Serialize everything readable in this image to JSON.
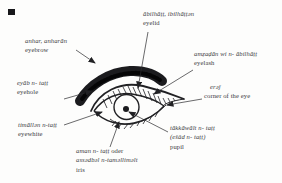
{
  "figure": {
    "background": "#fdfdfc",
    "ink_color": "#212124",
    "text_color": "#3b3b3f"
  },
  "labels": {
    "eyelid": {
      "term": "ābilhāṭṭ, ibilhāṭṭən",
      "gloss": "eyelid"
    },
    "eyebrow": {
      "term": "anhar, anharān",
      "gloss": "eyebrow"
    },
    "eyelash": {
      "term": "amẓaḍān wi n- ābilhāṭṭ",
      "gloss": "eyelash"
    },
    "eyehole": {
      "term": "eyāb n- taṭṭ",
      "gloss": "eyehole"
    },
    "corner": {
      "term": "erəǰ",
      "gloss": "corner of the eye"
    },
    "eyewhite": {
      "term": "timāllən n-taṭṭ",
      "gloss": "eyewhite"
    },
    "pupil": {
      "term": "tākkāwālt n- taṭṭ",
      "term2": "(ešâd n- taṭṭ)",
      "gloss": "pupil"
    },
    "iris": {
      "term": "aman n- taṭṭ",
      "conj": "oder",
      "term2": "assədbəl n-taməlliməlt",
      "gloss": "iris"
    }
  }
}
